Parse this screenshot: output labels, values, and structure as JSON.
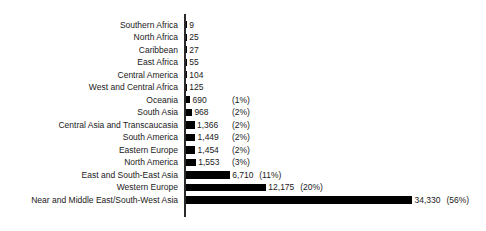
{
  "chart_data": {
    "type": "bar",
    "orientation": "horizontal",
    "title": "",
    "subtitle": "",
    "xlabel": "",
    "ylabel": "",
    "grid": false,
    "legend": "none",
    "xlim": [
      0,
      34330
    ],
    "axis_max_value": 34330,
    "categories": [
      "Southern Africa",
      "North Africa",
      "Caribbean",
      "East Africa",
      "Central America",
      "West and Central Africa",
      "Oceania",
      "South Asia",
      "Central Asia and Transcaucasia",
      "South America",
      "Eastern Europe",
      "North America",
      "East and South-East Asia",
      "Western Europe",
      "Near and Middle East/South-West Asia"
    ],
    "values": [
      9,
      25,
      27,
      55,
      104,
      125,
      690,
      968,
      1366,
      1449,
      1454,
      1553,
      6710,
      12175,
      34330
    ],
    "value_labels": [
      "9",
      "25",
      "27",
      "55",
      "104",
      "125",
      "690",
      "968",
      "1,366",
      "1,449",
      "1,454",
      "1,553",
      "6,710",
      "12,175",
      "34,330"
    ],
    "percent_labels": [
      "",
      "",
      "",
      "",
      "",
      "",
      "(1%)",
      "(2%)",
      "(2%)",
      "(2%)",
      "(2%)",
      "(3%)",
      "(11%)",
      "(20%)",
      "(56%)"
    ],
    "bar_color": "#000000",
    "axis_color": "#2a2a2a",
    "background_color": "#ffffff",
    "rows": [
      {
        "label": "Southern Africa",
        "value": 9,
        "value_label": "9",
        "percent_label": ""
      },
      {
        "label": "North Africa",
        "value": 25,
        "value_label": "25",
        "percent_label": ""
      },
      {
        "label": "Caribbean",
        "value": 27,
        "value_label": "27",
        "percent_label": ""
      },
      {
        "label": "East Africa",
        "value": 55,
        "value_label": "55",
        "percent_label": ""
      },
      {
        "label": "Central America",
        "value": 104,
        "value_label": "104",
        "percent_label": ""
      },
      {
        "label": "West and Central Africa",
        "value": 125,
        "value_label": "125",
        "percent_label": ""
      },
      {
        "label": "Oceania",
        "value": 690,
        "value_label": "690",
        "percent_label": "(1%)"
      },
      {
        "label": "South Asia",
        "value": 968,
        "value_label": "968",
        "percent_label": "(2%)"
      },
      {
        "label": "Central Asia and Transcaucasia",
        "value": 1366,
        "value_label": "1,366",
        "percent_label": "(2%)"
      },
      {
        "label": "South America",
        "value": 1449,
        "value_label": "1,449",
        "percent_label": "(2%)"
      },
      {
        "label": "Eastern Europe",
        "value": 1454,
        "value_label": "1,454",
        "percent_label": "(2%)"
      },
      {
        "label": "North America",
        "value": 1553,
        "value_label": "1,553",
        "percent_label": "(3%)"
      },
      {
        "label": "East and South-East Asia",
        "value": 6710,
        "value_label": "6,710",
        "percent_label": "(11%)"
      },
      {
        "label": "Western Europe",
        "value": 12175,
        "value_label": "12,175",
        "percent_label": "(20%)"
      },
      {
        "label": "Near and Middle East/South-West Asia",
        "value": 34330,
        "value_label": "34,330",
        "percent_label": "(56%)"
      }
    ]
  }
}
